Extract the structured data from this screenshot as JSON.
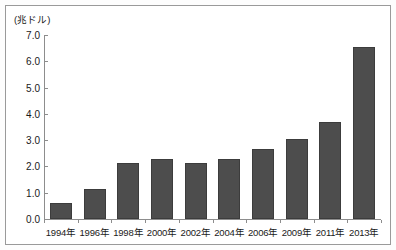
{
  "chart_data": {
    "type": "bar",
    "title": "",
    "subtitle": "",
    "unit_label": "(兆ドル)",
    "xlabel": "",
    "ylabel": "",
    "categories": [
      "1994年",
      "1996年",
      "1998年",
      "2000年",
      "2002年",
      "2004年",
      "2006年",
      "2009年",
      "2011年",
      "2013年"
    ],
    "values": [
      0.6,
      1.15,
      2.12,
      2.3,
      2.12,
      2.27,
      2.65,
      3.03,
      3.7,
      6.55
    ],
    "ylim": [
      0.0,
      7.0
    ],
    "ytick_step": 1.0,
    "ytick_labels": [
      "7.0",
      "6.0",
      "5.0",
      "4.0",
      "3.0",
      "2.0",
      "1.0",
      "0.0"
    ],
    "ytick_values": [
      7.0,
      6.0,
      5.0,
      4.0,
      3.0,
      2.0,
      1.0,
      0.0
    ],
    "grid": false,
    "legend": null,
    "legend_position": "none",
    "series": [
      {
        "name": "",
        "values": [
          0.6,
          1.15,
          2.12,
          2.3,
          2.12,
          2.27,
          2.65,
          3.03,
          3.7,
          6.55
        ]
      }
    ],
    "colors": {
      "bar_fill": "#4d4d4d",
      "bar_border": "#3c3c3c",
      "axis": "#8d8d8d",
      "text": "#1a1a1a",
      "frame": "#9a9a9a",
      "background": "#ffffff"
    }
  }
}
